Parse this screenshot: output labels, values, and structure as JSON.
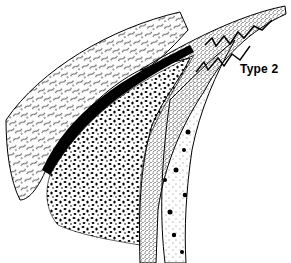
{
  "figure": {
    "label": "Type 2",
    "colors": {
      "ink": "#000000",
      "paper": "#ffffff"
    },
    "layers": [
      {
        "name": "fibrous-outer-layer",
        "pattern": "wavy-strokes"
      },
      {
        "name": "cancellous-mass",
        "pattern": "dense-speckles"
      },
      {
        "name": "dark-boundary-band",
        "pattern": "solid"
      },
      {
        "name": "stippled-band-with-zigzag",
        "pattern": "stipple"
      },
      {
        "name": "inner-layer-with-clusters",
        "pattern": "light-stipple-rosettes"
      }
    ]
  }
}
